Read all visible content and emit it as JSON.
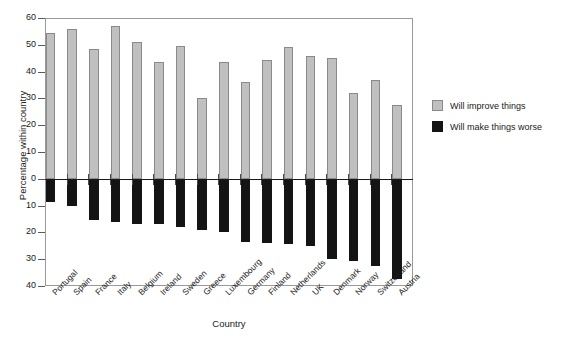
{
  "chart_data": {
    "type": "bar",
    "title": "",
    "xlabel": "Country",
    "ylabel": "Percentage within country",
    "ylim": [
      -40,
      60
    ],
    "yticks": [
      60,
      50,
      40,
      30,
      20,
      10,
      0,
      -10,
      -20,
      -30,
      -40
    ],
    "ytick_labels": [
      "60",
      "50",
      "40",
      "30",
      "20",
      "10",
      "0",
      "10",
      "20",
      "30",
      "40"
    ],
    "grid": false,
    "legend_position": "right",
    "categories": [
      "Portugal",
      "Spain",
      "France",
      "Italy",
      "Belgium",
      "Ireland",
      "Sweden",
      "Greece",
      "Luxembourg",
      "Germany",
      "Finland",
      "Netherlands",
      "UK",
      "Denmark",
      "Norway",
      "Switzerland",
      "Austria"
    ],
    "series": [
      {
        "name": "Will improve things",
        "color": "#c0c0c0",
        "values": [
          54.5,
          56,
          48.5,
          57,
          51,
          43.5,
          49.5,
          30,
          43.5,
          36,
          44.5,
          49,
          46,
          45,
          32,
          37,
          27.5
        ]
      },
      {
        "name": "Will make things worse",
        "color": "#141414",
        "values": [
          -8.5,
          -10,
          -15.5,
          -16,
          -17,
          -17,
          -18,
          -19,
          -20,
          -23.5,
          -24,
          -24.5,
          -25,
          -30,
          -30.5,
          -32.5,
          -37.5
        ]
      }
    ]
  },
  "legend": {
    "items": [
      {
        "label": "Will improve things",
        "swatch": "improve"
      },
      {
        "label": "Will make things worse",
        "swatch": "worse"
      }
    ]
  },
  "axes": {
    "y_title": "Percentage within country",
    "x_title": "Country"
  }
}
